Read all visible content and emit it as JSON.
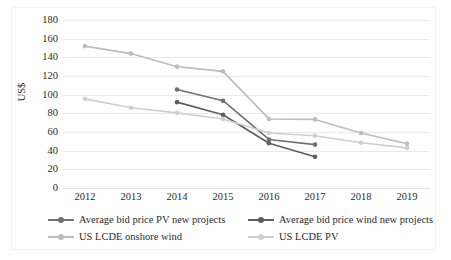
{
  "chart_data": {
    "type": "line",
    "title": "",
    "xlabel": "",
    "ylabel": "US$",
    "categories": [
      "2012",
      "2013",
      "2014",
      "2015",
      "2016",
      "2017",
      "2018",
      "2019"
    ],
    "x": [
      2012,
      2013,
      2014,
      2015,
      2016,
      2017,
      2018,
      2019
    ],
    "ylim": [
      0,
      180
    ],
    "ytick_labels": [
      "0",
      "20",
      "40",
      "60",
      "80",
      "100",
      "120",
      "140",
      "160",
      "180"
    ],
    "ytick_values": [
      0,
      20,
      40,
      60,
      80,
      100,
      120,
      140,
      160,
      180
    ],
    "grid": true,
    "legend_position": "bottom",
    "series": [
      {
        "name": "Average bid price PV new projects",
        "color": "#707070",
        "marker": "circle",
        "x": [
          2014,
          2015,
          2016,
          2017
        ],
        "values": [
          105.5,
          93.5,
          52.0,
          46.5
        ]
      },
      {
        "name": "Average bid price wind new projects",
        "color": "#5e5e5e",
        "marker": "circle",
        "x": [
          2014,
          2015,
          2016,
          2017
        ],
        "values": [
          92.0,
          78.5,
          48.0,
          33.5
        ]
      },
      {
        "name": "US LCDE onshore wind",
        "color": "#bdbdbd",
        "marker": "circle",
        "x": [
          2012,
          2013,
          2014,
          2015,
          2016,
          2017,
          2018,
          2019
        ],
        "values": [
          152.0,
          144.0,
          130.0,
          125.0,
          74.0,
          73.5,
          59.0,
          47.5
        ]
      },
      {
        "name": "US LCDE PV",
        "color": "#cfcfcf",
        "marker": "circle",
        "x": [
          2012,
          2013,
          2014,
          2015,
          2016,
          2017,
          2018,
          2019
        ],
        "values": [
          95.5,
          86.0,
          80.5,
          74.0,
          59.0,
          56.0,
          48.5,
          43.0
        ]
      }
    ]
  },
  "legend": {
    "items": [
      {
        "label": "Average bid price PV new projects"
      },
      {
        "label": "Average bid price wind new projects"
      },
      {
        "label": "US LCDE onshore wind"
      },
      {
        "label": "US LCDE PV"
      }
    ]
  },
  "colors": {
    "grid": "#eaeaea",
    "text": "#2b2b2b",
    "background": "#ffffff",
    "frame": "#f2f2f2"
  }
}
